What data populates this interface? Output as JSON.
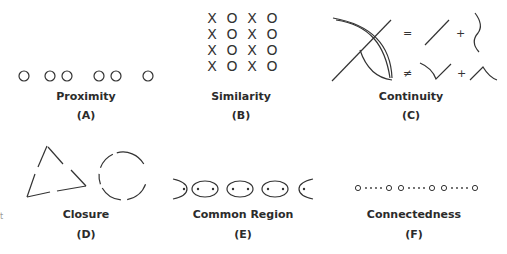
{
  "panels": [
    {
      "id": "A",
      "title": "Proximity",
      "label": "(A)"
    },
    {
      "id": "B",
      "title": "Similarity",
      "label": "(B)",
      "grid": [
        [
          "X",
          "O",
          "X",
          "O"
        ],
        [
          "X",
          "O",
          "X",
          "O"
        ],
        [
          "X",
          "O",
          "X",
          "O"
        ],
        [
          "X",
          "O",
          "X",
          "O"
        ]
      ]
    },
    {
      "id": "C",
      "title": "Continuity",
      "label": "(C)",
      "symbols": {
        "equals": "=",
        "not_equals": "≠",
        "plus": "+"
      }
    },
    {
      "id": "D",
      "title": "Closure",
      "label": "(D)"
    },
    {
      "id": "E",
      "title": "Common Region",
      "label": "(E)"
    },
    {
      "id": "F",
      "title": "Connectedness",
      "label": "(F)"
    }
  ],
  "edge_fragment": "t"
}
